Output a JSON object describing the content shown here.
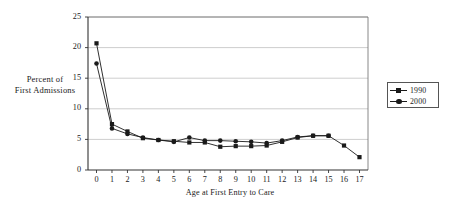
{
  "chart_data": {
    "type": "line",
    "title": "",
    "xlabel": "Age at First Entry to Care",
    "ylabel": "Percent of First Admissions",
    "ylabel_lines": [
      "Percent of",
      "First Admissions"
    ],
    "x": [
      0,
      1,
      2,
      3,
      4,
      5,
      6,
      7,
      8,
      9,
      10,
      11,
      12,
      13,
      14,
      15,
      16,
      17
    ],
    "xticklabels": [
      "0",
      "1",
      "2",
      "3",
      "4",
      "5",
      "6",
      "7",
      "8",
      "9",
      "10",
      "11",
      "12",
      "13",
      "14",
      "15",
      "16",
      "17"
    ],
    "yticklabels": [
      "0",
      "5",
      "10",
      "15",
      "20",
      "25"
    ],
    "yticks": [
      0,
      5,
      10,
      15,
      20,
      25
    ],
    "xlim": [
      -0.55,
      17.55
    ],
    "ylim": [
      0,
      25
    ],
    "grid": "horizontal",
    "legend_position": "right-outside",
    "series": [
      {
        "name": "1990",
        "marker": "square",
        "color": "#1a1a1a",
        "values": [
          20.7,
          7.5,
          6.3,
          5.2,
          4.9,
          4.7,
          4.5,
          4.5,
          3.8,
          3.9,
          3.9,
          4.0,
          4.6,
          5.3,
          5.6,
          5.6,
          4.0,
          2.1
        ]
      },
      {
        "name": "2000",
        "marker": "circle",
        "color": "#1a1a1a",
        "values": [
          17.4,
          6.8,
          5.9,
          5.3,
          4.9,
          4.6,
          5.3,
          4.8,
          4.8,
          4.7,
          4.6,
          4.4,
          4.8,
          5.4,
          5.6,
          5.6,
          null,
          null
        ]
      }
    ]
  },
  "legend": {
    "entries": [
      {
        "label": "1990"
      },
      {
        "label": "2000"
      }
    ]
  }
}
